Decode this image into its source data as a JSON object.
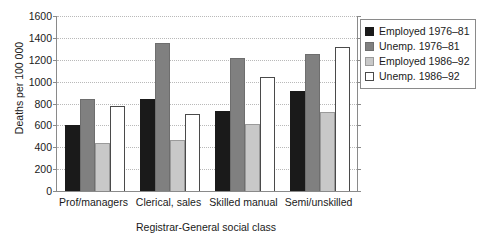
{
  "chart_data": {
    "type": "bar",
    "title": "",
    "xlabel": "Registrar-General social class",
    "ylabel": "Deaths per 100 000",
    "categories": [
      "Prof/managers",
      "Clerical, sales",
      "Skilled manual",
      "Semi/unskilled"
    ],
    "series": [
      {
        "name": "Employed 1976–81",
        "color": "#1a1a1a",
        "values": [
          600,
          840,
          735,
          910
        ]
      },
      {
        "name": "Unemp. 1976–81",
        "color": "#808080",
        "values": [
          840,
          1355,
          1215,
          1250
        ]
      },
      {
        "name": "Employed 1986–92",
        "color": "#c8c8c8",
        "values": [
          440,
          465,
          610,
          720
        ]
      },
      {
        "name": "Unemp. 1986–92",
        "color": "#ffffff",
        "values": [
          780,
          700,
          1040,
          1320
        ]
      }
    ],
    "ylim": [
      0,
      1600
    ],
    "yticks": [
      0,
      200,
      400,
      600,
      800,
      1000,
      1200,
      1400,
      1600
    ],
    "ytick_labels": [
      "0",
      "200",
      "400",
      "600",
      "800",
      "1000",
      "1200",
      "1400",
      "1600"
    ],
    "grid": true,
    "grid_style": "dotted horizontal",
    "legend_position": "right-outside"
  }
}
